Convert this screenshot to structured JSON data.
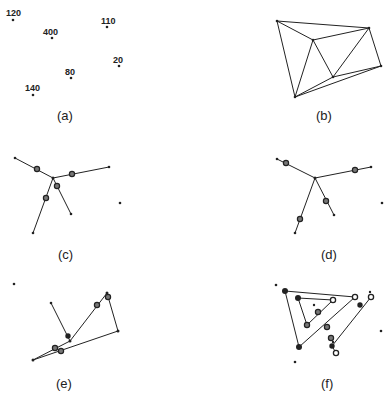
{
  "figure": {
    "panels": [
      {
        "id": "a",
        "caption": "(a)",
        "points": [
          {
            "label": "120",
            "x": 13,
            "y": 20
          },
          {
            "label": "400",
            "x": 52,
            "y": 38
          },
          {
            "label": "110",
            "x": 107,
            "y": 27
          },
          {
            "label": "20",
            "x": 119,
            "y": 66
          },
          {
            "label": "80",
            "x": 71,
            "y": 78
          },
          {
            "label": "140",
            "x": 33,
            "y": 95
          }
        ]
      },
      {
        "id": "b",
        "caption": "(b)"
      },
      {
        "id": "c",
        "caption": "(c)"
      },
      {
        "id": "d",
        "caption": "(d)"
      },
      {
        "id": "e",
        "caption": "(e)"
      },
      {
        "id": "f",
        "caption": "(f)"
      }
    ]
  }
}
